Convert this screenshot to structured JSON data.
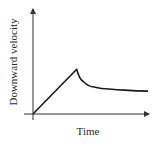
{
  "chart_data": {
    "type": "line",
    "title": "",
    "xlabel": "Time",
    "ylabel": "Downward velocity",
    "grid": false,
    "legend": null,
    "axis_ticks": "none",
    "series": [
      {
        "name": "Downward velocity",
        "description": "Linear increase from zero to a peak, then a sharp drop followed by exponential-like decay toward a constant terminal value",
        "points_normalized": [
          {
            "t": 0.0,
            "v": 0.0
          },
          {
            "t": 0.38,
            "v": 0.43
          },
          {
            "t": 0.44,
            "v": 0.31
          },
          {
            "t": 0.53,
            "v": 0.26
          },
          {
            "t": 0.66,
            "v": 0.24
          },
          {
            "t": 0.8,
            "v": 0.23
          },
          {
            "t": 1.0,
            "v": 0.22
          }
        ]
      }
    ]
  },
  "labels": {
    "x": "Time",
    "y": "Downward velocity"
  },
  "colors": {
    "axis": "#333333",
    "curve": "#1a1a1a",
    "text": "#2a2a2a"
  }
}
